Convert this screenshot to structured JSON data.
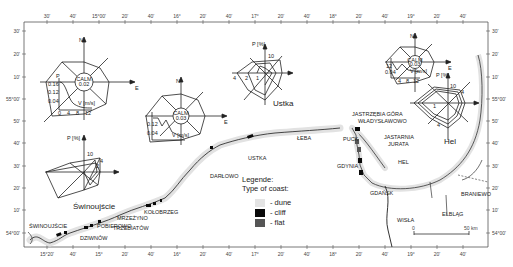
{
  "frame": {
    "top_ticks": [
      "30'",
      "40'",
      "15°00'",
      "20'",
      "40'",
      "16°",
      "20'",
      "40'",
      "17°",
      "20'",
      "40'",
      "18°",
      "20'",
      "40'",
      "19°",
      "20'",
      "40'"
    ],
    "bottom_ticks": [
      "15°20'",
      "40'",
      "15°",
      "20'",
      "40'",
      "16°",
      "20'",
      "40'",
      "17°",
      "20'",
      "40'",
      "18°",
      "20'",
      "40'",
      "19°",
      "20'",
      "40'"
    ],
    "left_ticks": [
      "30'",
      "20'",
      "10'",
      "55°00'",
      "50'",
      "40'",
      "30'",
      "20'",
      "10'",
      "54°00'"
    ],
    "right_ticks": [
      "30'",
      "20'",
      "10'",
      "55°00'",
      "50'",
      "40'",
      "30'",
      "20'",
      "10'",
      "54°00'"
    ]
  },
  "wind_roses": [
    {
      "id": "rose-1",
      "north": "N",
      "east": "E",
      "calm_label": "CALM",
      "calm_value": "0.02",
      "p_axis": "P",
      "p_ticks": [
        "0.16",
        "0.12",
        "0.04"
      ],
      "v_axis": "V [m/s]",
      "v_ticks": [
        "0",
        "4",
        "8",
        "12"
      ]
    },
    {
      "id": "rose-2",
      "north": "N",
      "east": "E",
      "calm_label": "CALM",
      "calm_value": "0.03",
      "p_axis": "P",
      "p_ticks": [
        "0.12",
        "0.04"
      ],
      "v_axis": "V [m/s]",
      "v_ticks": [
        "0",
        "4",
        "8",
        "12"
      ]
    },
    {
      "id": "rose-3",
      "north": "N",
      "east": "E",
      "calm_label": "CALM",
      "calm_value": "0.03",
      "p_axis": "P",
      "p_ticks": [
        "12",
        "0.04"
      ],
      "v_axis": "V [m/s]",
      "v_ticks": [
        "4",
        "8",
        "12"
      ]
    }
  ],
  "wave_roses": [
    {
      "id": "ustka",
      "name": "Ustka",
      "axis": "P [%]",
      "ticks": [
        "10",
        "4",
        "2",
        "1"
      ]
    },
    {
      "id": "swinoujscie",
      "name": "Świnoujście",
      "axis": "P [%]",
      "ticks": [
        "10",
        "4",
        "2"
      ]
    },
    {
      "id": "hel",
      "name": "Hel",
      "axis": "P [%]",
      "ticks": [
        "10",
        "4",
        "1",
        "4"
      ]
    }
  ],
  "places": [
    "ŚWINOUJŚCIE",
    "DZIWNÓW",
    "POBIEROWO",
    "MRZEŻYNO",
    "TRZEBIATÓW",
    "KOŁOBRZEG",
    "DARŁOWO",
    "USTKA",
    "ŁEBA",
    "JASTRZĘBIA GÓRA",
    "WŁADYSŁAWOWO",
    "PUCK",
    "JASTARNIA",
    "JURATA",
    "HEL",
    "GDYNIA",
    "GDAŃSK",
    "WISŁA",
    "ELBLĄG",
    "BRANIEWO"
  ],
  "legend": {
    "title": "Legende:",
    "subtitle": "Type of coast:",
    "items": [
      {
        "label": "- dune",
        "color": "#e4e4e4"
      },
      {
        "label": "- cliff",
        "color": "#0a0a0a"
      },
      {
        "label": "- flat",
        "color": "#555555"
      }
    ]
  },
  "scale_bar": {
    "start": "0",
    "end": "50 km"
  }
}
